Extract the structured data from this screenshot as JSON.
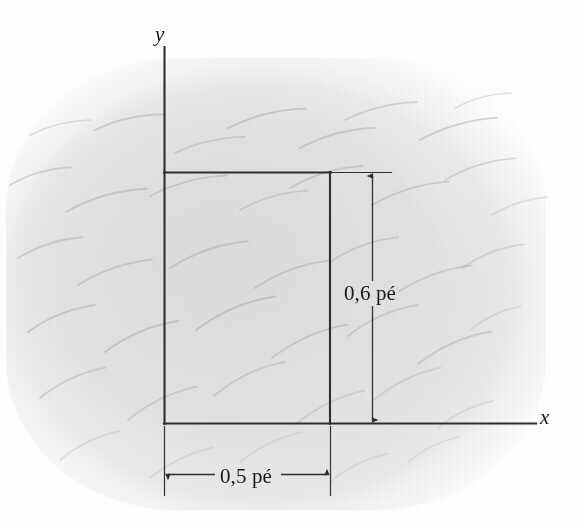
{
  "figure": {
    "kind": "flow-visualization-photograph-with-overlay",
    "axes": {
      "x_label": "x",
      "y_label": "y",
      "origin_label": ""
    },
    "dimensions": {
      "height_label": "0,6 pé",
      "width_label": "0,5 pé",
      "height_value": 0.6,
      "width_value": 0.5,
      "unit": "pé"
    },
    "colors": {
      "line": "#2e2e2e",
      "text": "#171717",
      "photo_gray": "#e2e2e2",
      "streak_gray": "#b9b9b9",
      "page_white": "#ffffff"
    },
    "geometry": {
      "y_axis_x": 164,
      "y_axis_top": 47,
      "x_axis_y": 423,
      "x_axis_right": 536,
      "rect_left": 164,
      "rect_right": 330,
      "rect_top": 172,
      "rect_bottom": 423,
      "vdim_x": 372,
      "hdim_y": 475
    }
  },
  "chart_data": {
    "type": "scatter",
    "title": "",
    "xlabel": "x",
    "ylabel": "y",
    "annotations": [
      "0,6 pé",
      "0,5 pé"
    ],
    "control_volume": {
      "x_min": 0.0,
      "x_max": 0.5,
      "y_min": 0.0,
      "y_max": 0.6,
      "unit": "pé"
    },
    "streaklines": [
      {
        "x": 30,
        "y": 135,
        "len": 62,
        "angle": -14,
        "curve": -7,
        "w": 1.7,
        "op": 0.4
      },
      {
        "x": 95,
        "y": 130,
        "len": 70,
        "angle": -13,
        "curve": -8,
        "w": 1.8,
        "op": 0.48
      },
      {
        "x": 175,
        "y": 153,
        "len": 72,
        "angle": -13,
        "curve": -8,
        "w": 1.7,
        "op": 0.42
      },
      {
        "x": 228,
        "y": 128,
        "len": 80,
        "angle": -14,
        "curve": -9,
        "w": 1.9,
        "op": 0.52
      },
      {
        "x": 300,
        "y": 148,
        "len": 78,
        "angle": -15,
        "curve": -9,
        "w": 1.8,
        "op": 0.5
      },
      {
        "x": 345,
        "y": 120,
        "len": 74,
        "angle": -14,
        "curve": -8,
        "w": 1.7,
        "op": 0.44
      },
      {
        "x": 420,
        "y": 140,
        "len": 80,
        "angle": -16,
        "curve": -9,
        "w": 1.8,
        "op": 0.46
      },
      {
        "x": 455,
        "y": 108,
        "len": 58,
        "angle": -15,
        "curve": -7,
        "w": 1.6,
        "op": 0.34
      },
      {
        "x": 10,
        "y": 185,
        "len": 64,
        "angle": -16,
        "curve": -8,
        "w": 1.8,
        "op": 0.44
      },
      {
        "x": 66,
        "y": 212,
        "len": 84,
        "angle": -16,
        "curve": -10,
        "w": 1.9,
        "op": 0.5
      },
      {
        "x": 150,
        "y": 196,
        "len": 80,
        "angle": -15,
        "curve": -9,
        "w": 1.8,
        "op": 0.46
      },
      {
        "x": 240,
        "y": 210,
        "len": 70,
        "angle": -16,
        "curve": -8,
        "w": 1.7,
        "op": 0.42
      },
      {
        "x": 290,
        "y": 188,
        "len": 76,
        "angle": -17,
        "curve": -9,
        "w": 1.8,
        "op": 0.48
      },
      {
        "x": 372,
        "y": 205,
        "len": 80,
        "angle": -17,
        "curve": -9,
        "w": 1.8,
        "op": 0.46
      },
      {
        "x": 445,
        "y": 180,
        "len": 74,
        "angle": -17,
        "curve": -9,
        "w": 1.7,
        "op": 0.4
      },
      {
        "x": 492,
        "y": 215,
        "len": 58,
        "angle": -18,
        "curve": -7,
        "w": 1.6,
        "op": 0.32
      },
      {
        "x": 18,
        "y": 258,
        "len": 68,
        "angle": -18,
        "curve": -8,
        "w": 1.8,
        "op": 0.46
      },
      {
        "x": 78,
        "y": 285,
        "len": 78,
        "angle": -19,
        "curve": -9,
        "w": 1.9,
        "op": 0.5
      },
      {
        "x": 170,
        "y": 268,
        "len": 82,
        "angle": -19,
        "curve": -10,
        "w": 1.9,
        "op": 0.5
      },
      {
        "x": 255,
        "y": 288,
        "len": 80,
        "angle": -20,
        "curve": -10,
        "w": 1.9,
        "op": 0.5
      },
      {
        "x": 330,
        "y": 262,
        "len": 72,
        "angle": -20,
        "curve": -9,
        "w": 1.8,
        "op": 0.42
      },
      {
        "x": 398,
        "y": 292,
        "len": 78,
        "angle": -20,
        "curve": -9,
        "w": 1.8,
        "op": 0.44
      },
      {
        "x": 462,
        "y": 268,
        "len": 66,
        "angle": -21,
        "curve": -8,
        "w": 1.7,
        "op": 0.36
      },
      {
        "x": 28,
        "y": 332,
        "len": 72,
        "angle": -22,
        "curve": -9,
        "w": 1.9,
        "op": 0.48
      },
      {
        "x": 105,
        "y": 352,
        "len": 80,
        "angle": -23,
        "curve": -10,
        "w": 2.0,
        "op": 0.52
      },
      {
        "x": 196,
        "y": 330,
        "len": 86,
        "angle": -23,
        "curve": -11,
        "w": 2.0,
        "op": 0.52
      },
      {
        "x": 272,
        "y": 358,
        "len": 82,
        "angle": -24,
        "curve": -10,
        "w": 1.9,
        "op": 0.5
      },
      {
        "x": 348,
        "y": 336,
        "len": 76,
        "angle": -24,
        "curve": -10,
        "w": 1.8,
        "op": 0.44
      },
      {
        "x": 418,
        "y": 364,
        "len": 80,
        "angle": -24,
        "curve": -10,
        "w": 1.8,
        "op": 0.44
      },
      {
        "x": 470,
        "y": 330,
        "len": 56,
        "angle": -25,
        "curve": -7,
        "w": 1.6,
        "op": 0.3
      },
      {
        "x": 40,
        "y": 398,
        "len": 72,
        "angle": -25,
        "curve": -9,
        "w": 1.9,
        "op": 0.44
      },
      {
        "x": 128,
        "y": 420,
        "len": 76,
        "angle": -26,
        "curve": -9,
        "w": 1.8,
        "op": 0.4
      },
      {
        "x": 214,
        "y": 396,
        "len": 78,
        "angle": -26,
        "curve": -10,
        "w": 1.8,
        "op": 0.42
      },
      {
        "x": 296,
        "y": 424,
        "len": 76,
        "angle": -26,
        "curve": -9,
        "w": 1.7,
        "op": 0.38
      },
      {
        "x": 374,
        "y": 400,
        "len": 74,
        "angle": -26,
        "curve": -9,
        "w": 1.7,
        "op": 0.36
      },
      {
        "x": 438,
        "y": 428,
        "len": 62,
        "angle": -26,
        "curve": -8,
        "w": 1.6,
        "op": 0.3
      },
      {
        "x": 60,
        "y": 460,
        "len": 66,
        "angle": -26,
        "curve": -8,
        "w": 1.7,
        "op": 0.3
      },
      {
        "x": 150,
        "y": 478,
        "len": 70,
        "angle": -26,
        "curve": -8,
        "w": 1.7,
        "op": 0.28
      },
      {
        "x": 240,
        "y": 462,
        "len": 68,
        "angle": -26,
        "curve": -8,
        "w": 1.6,
        "op": 0.26
      },
      {
        "x": 330,
        "y": 482,
        "len": 64,
        "angle": -26,
        "curve": -8,
        "w": 1.6,
        "op": 0.24
      },
      {
        "x": 408,
        "y": 462,
        "len": 58,
        "angle": -26,
        "curve": -7,
        "w": 1.5,
        "op": 0.22
      }
    ]
  }
}
